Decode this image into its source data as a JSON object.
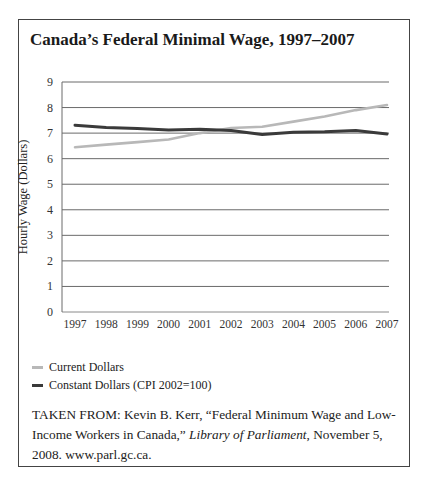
{
  "title": "Canada’s Federal Minimal Wage, 1997–2007",
  "chart_data": {
    "type": "line",
    "title": "Canada’s Federal Minimal Wage, 1997–2007",
    "xlabel": "",
    "ylabel": "Hourly Wage (Dollars)",
    "ylim": [
      0,
      9
    ],
    "yticks": [
      0,
      1,
      2,
      3,
      4,
      5,
      6,
      7,
      8,
      9
    ],
    "grid": true,
    "legend_position": "bottom-left",
    "categories": [
      "1997",
      "1998",
      "1999",
      "2000",
      "2001",
      "2002",
      "2003",
      "2004",
      "2005",
      "2006",
      "2007"
    ],
    "series": [
      {
        "name": "Current Dollars",
        "color": "#b8b8b8",
        "values": [
          6.45,
          6.55,
          6.65,
          6.75,
          7.0,
          7.2,
          7.25,
          7.45,
          7.65,
          7.9,
          8.1
        ]
      },
      {
        "name": "Constant Dollars (CPI 2002=100)",
        "color": "#3a3a3a",
        "values": [
          7.31,
          7.22,
          7.18,
          7.12,
          7.15,
          7.1,
          6.95,
          7.03,
          7.05,
          7.1,
          6.96
        ]
      }
    ]
  },
  "legend": {
    "items": [
      {
        "label": "Current Dollars",
        "color": "#b8b8b8"
      },
      {
        "label": "Constant Dollars (CPI 2002=100)",
        "color": "#3a3a3a"
      }
    ]
  },
  "source": {
    "prefix": "TAKEN FROM: Kevin B. Kerr, “Federal Minimum Wage and Low-Income Workers in Canada,” ",
    "publication": "Library of Parliament",
    "suffix": ", November 5, 2008. www.parl.gc.ca."
  }
}
